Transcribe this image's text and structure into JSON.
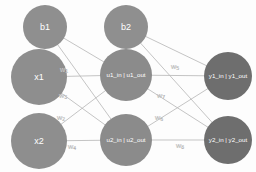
{
  "diagram": {
    "type": "neural-network-graph",
    "background_color": "#fdfdfd",
    "edge_color": "#b9b9b9",
    "node_text_color": "#ffffff",
    "weight_text_color": "#e8e8e8",
    "nodes": [
      {
        "id": "b1",
        "label": "b1",
        "layer": "bias-input",
        "cx": 45,
        "cy": 27,
        "r": 22,
        "color": "#8f8f8f",
        "label_size": "big"
      },
      {
        "id": "x1",
        "label": "x1",
        "layer": "input",
        "cx": 39,
        "cy": 77,
        "r": 28,
        "color": "#8e8e8e",
        "label_size": "big"
      },
      {
        "id": "x2",
        "label": "x2",
        "layer": "input",
        "cx": 39,
        "cy": 141,
        "r": 28,
        "color": "#8e8e8e",
        "label_size": "big"
      },
      {
        "id": "b2",
        "label": "b2",
        "layer": "bias-hidden",
        "cx": 126,
        "cy": 27,
        "r": 22,
        "color": "#8f8f8f",
        "label_size": "big"
      },
      {
        "id": "u1",
        "label": "u1_in | u1_out",
        "layer": "hidden",
        "cx": 126,
        "cy": 75,
        "r": 26,
        "color": "#8b8b8b",
        "label_size": "small"
      },
      {
        "id": "u2",
        "label": "u2_in | u2_out",
        "layer": "hidden",
        "cx": 126,
        "cy": 140,
        "r": 26,
        "color": "#8b8b8b",
        "label_size": "small"
      },
      {
        "id": "y1",
        "label": "y1_in | y1_out",
        "layer": "output",
        "cx": 228,
        "cy": 76,
        "r": 24,
        "color": "#6e6e6e",
        "label_size": "small"
      },
      {
        "id": "y2",
        "label": "y2_in | y2_out",
        "layer": "output",
        "cx": 228,
        "cy": 140,
        "r": 24,
        "color": "#6e6e6e",
        "label_size": "small"
      }
    ],
    "edges": [
      {
        "id": "b1-u1",
        "from": "b1",
        "to": "u1",
        "weight": null
      },
      {
        "id": "b1-u2",
        "from": "b1",
        "to": "u2",
        "weight": null
      },
      {
        "id": "x1-u1",
        "from": "x1",
        "to": "u1",
        "weight": "w1"
      },
      {
        "id": "x1-u2",
        "from": "x1",
        "to": "u2",
        "weight": "w3"
      },
      {
        "id": "x2-u1",
        "from": "x2",
        "to": "u1",
        "weight": "w2"
      },
      {
        "id": "x2-u2",
        "from": "x2",
        "to": "u2",
        "weight": "w4"
      },
      {
        "id": "b2-y1",
        "from": "b2",
        "to": "y1",
        "weight": null
      },
      {
        "id": "b2-y2",
        "from": "b2",
        "to": "y2",
        "weight": null
      },
      {
        "id": "u1-y1",
        "from": "u1",
        "to": "y1",
        "weight": "w5"
      },
      {
        "id": "u1-y2",
        "from": "u1",
        "to": "y2",
        "weight": "w7"
      },
      {
        "id": "u2-y1",
        "from": "u2",
        "to": "y1",
        "weight": "w6"
      },
      {
        "id": "u2-y2",
        "from": "u2",
        "to": "y2",
        "weight": "w8"
      }
    ],
    "weight_labels": [
      {
        "id": "w1",
        "base": "w",
        "sub": "1",
        "x": 64,
        "y": 70
      },
      {
        "id": "w3",
        "base": "w",
        "sub": "3",
        "x": 63,
        "y": 96
      },
      {
        "id": "w2",
        "base": "w",
        "sub": "2",
        "x": 61,
        "y": 118
      },
      {
        "id": "w4",
        "base": "w",
        "sub": "4",
        "x": 72,
        "y": 147
      },
      {
        "id": "w5",
        "base": "w",
        "sub": "5",
        "x": 175,
        "y": 67
      },
      {
        "id": "w7",
        "base": "w",
        "sub": "7",
        "x": 161,
        "y": 96
      },
      {
        "id": "w6",
        "base": "w",
        "sub": "6",
        "x": 159,
        "y": 118
      },
      {
        "id": "w8",
        "base": "w",
        "sub": "8",
        "x": 180,
        "y": 146
      }
    ]
  }
}
